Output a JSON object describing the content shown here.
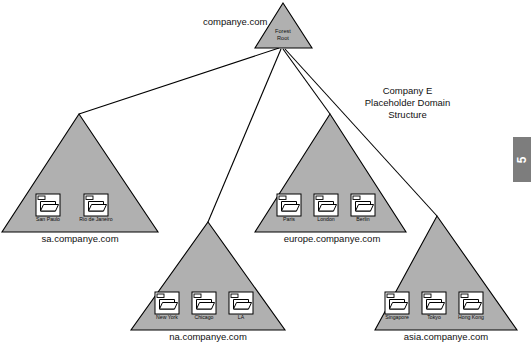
{
  "diagram": {
    "title_lines": [
      "Company E",
      "Placeholder Domain",
      "Structure"
    ],
    "page_number": "5",
    "colors": {
      "triangle_fill": "#b0b0b0",
      "outline": "#000000",
      "folder_fill": "#ffffff",
      "page_tab": "#7d7d7d"
    },
    "root": {
      "domain_label": "companye.com",
      "inner_line_1": "Forest",
      "inner_line_2": "Root"
    },
    "domains": [
      {
        "id": "sa",
        "caption": "sa.companye.com",
        "folders": [
          "San Paulo",
          "Rio de Janeiro"
        ]
      },
      {
        "id": "europe",
        "caption": "europe.companye.com",
        "folders": [
          "Paris",
          "London",
          "Berlin"
        ]
      },
      {
        "id": "na",
        "caption": "na.companye.com",
        "folders": [
          "New York",
          "Chicago",
          "LA"
        ]
      },
      {
        "id": "asia",
        "caption": "asia.companye.com",
        "folders": [
          "Singapore",
          "Tokyo",
          "Hong Kong"
        ]
      }
    ]
  }
}
